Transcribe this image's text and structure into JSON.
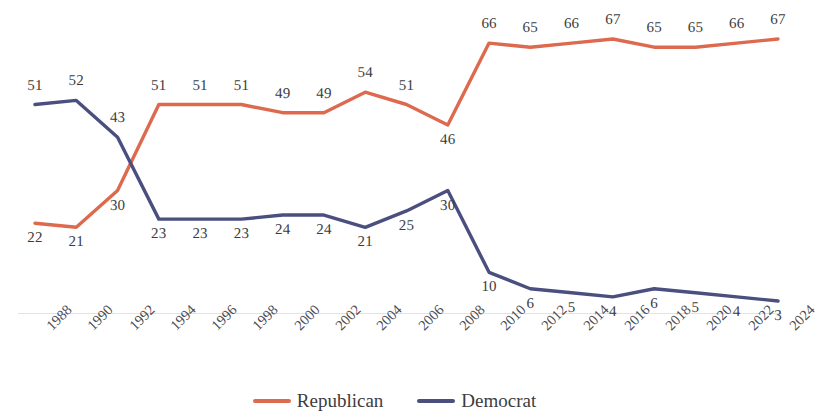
{
  "chart_data": {
    "type": "line",
    "title": "",
    "subtitle": "",
    "xlabel": "",
    "ylabel": "",
    "grid": false,
    "legend_position": "bottom",
    "ylim": [
      0,
      70
    ],
    "categories": [
      "1988",
      "1990",
      "1992",
      "1994",
      "1996",
      "1998",
      "2000",
      "2002",
      "2004",
      "2006",
      "2008",
      "2010",
      "2012",
      "2014",
      "2016",
      "2018",
      "2020",
      "2022",
      "2024"
    ],
    "series": [
      {
        "name": "Republican",
        "color": "#DD6A4E",
        "values": [
          22,
          21,
          30,
          51,
          51,
          51,
          49,
          49,
          54,
          51,
          46,
          66,
          65,
          66,
          67,
          65,
          65,
          66,
          67
        ],
        "label_side": [
          "below",
          "below",
          "below",
          "above",
          "above",
          "above",
          "above",
          "above",
          "above",
          "above",
          "below",
          "above",
          "above",
          "above",
          "above",
          "above",
          "above",
          "above",
          "above"
        ]
      },
      {
        "name": "Democrat",
        "color": "#4B4F80",
        "values": [
          51,
          52,
          43,
          23,
          23,
          23,
          24,
          24,
          21,
          25,
          30,
          10,
          6,
          5,
          4,
          6,
          5,
          4,
          3
        ],
        "label_side": [
          "above",
          "above",
          "above",
          "below",
          "below",
          "below",
          "below",
          "below",
          "below",
          "below",
          "below",
          "below",
          "below",
          "below",
          "below",
          "below",
          "below",
          "below",
          "below"
        ]
      }
    ],
    "legend": [
      {
        "label": "Republican",
        "color": "#DD6A4E"
      },
      {
        "label": "Democrat",
        "color": "#4B4F80"
      }
    ]
  }
}
